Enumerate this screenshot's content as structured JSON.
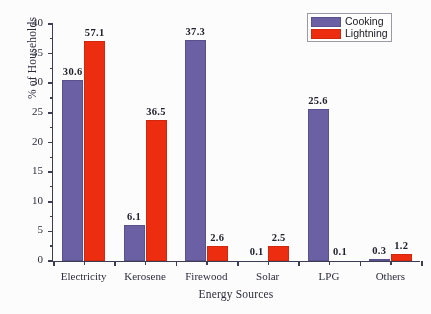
{
  "chart_data": {
    "type": "bar",
    "title": "",
    "xlabel": "Energy Sources",
    "ylabel": "% of Households",
    "categories": [
      "Electricity",
      "Kerosene",
      "Firewood",
      "Solar",
      "LPG",
      "Others"
    ],
    "series": [
      {
        "name": "Cooking",
        "color": "#6b5fa6",
        "values": [
          30.6,
          6.1,
          37.3,
          0.1,
          25.6,
          0.3
        ]
      },
      {
        "name": "Lightning",
        "color": "#f22b0c",
        "values": [
          57.1,
          36.5,
          2.6,
          2.5,
          0.1,
          1.2
        ]
      }
    ],
    "value_labels": {
      "Cooking": [
        "30.6",
        "6.1",
        "37.3",
        "0.1",
        "25.6",
        "0.3"
      ],
      "Lightning": [
        "57.1",
        "36.5",
        "2.6",
        "2.5",
        "0.1",
        "1.2"
      ]
    },
    "drawn_heights": {
      "Cooking": [
        30.6,
        6.1,
        37.3,
        0.1,
        25.6,
        0.3
      ],
      "Lightning": [
        37.2,
        23.8,
        2.6,
        2.5,
        0.1,
        1.2
      ]
    },
    "ylim": [
      0,
      40
    ],
    "yticks": [
      0,
      5,
      10,
      15,
      20,
      25,
      30,
      35,
      40
    ],
    "ytick_labels": [
      "0",
      "5",
      "10",
      "15",
      "20",
      "25",
      "30",
      "35",
      "40"
    ],
    "grid": false,
    "legend_position": "top-right"
  },
  "legend": {
    "items": [
      {
        "label": "Cooking"
      },
      {
        "label": "Lightning"
      }
    ]
  }
}
